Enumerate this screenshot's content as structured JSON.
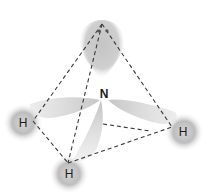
{
  "diagram": {
    "central_atom": {
      "label": "N",
      "x": 104,
      "y": 94
    },
    "lone_pair_lobe": {
      "x": 102,
      "y": 44
    },
    "hydrogens": [
      {
        "label": "H",
        "position": "left",
        "x": 23,
        "y": 123
      },
      {
        "label": "H",
        "position": "bottom",
        "x": 69,
        "y": 173
      },
      {
        "label": "H",
        "position": "right",
        "x": 183,
        "y": 132
      }
    ],
    "tetrahedron_vertices": {
      "top": [
        102,
        24
      ],
      "left": [
        33,
        121
      ],
      "bottom": [
        68,
        163
      ],
      "right": [
        172,
        127
      ]
    },
    "colors": {
      "background": "#ffffff",
      "lobe": "#b8b8b8",
      "atom": "#9a9a9a",
      "edge": "#3a3a3a",
      "label": "#1a1a1a"
    }
  }
}
